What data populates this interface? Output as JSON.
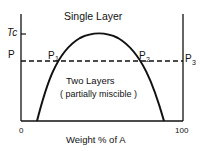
{
  "diagram": {
    "title_region_top": "Single Layer",
    "region_bottom_line1": "Two Layers",
    "region_bottom_line2": "( partially miscible )",
    "y_labels": {
      "tc": "Tc",
      "p": "P"
    },
    "points": {
      "p1": "P",
      "p1_sub": "1",
      "p2": "P",
      "p2_sub": "2",
      "p3": "P",
      "p3_sub": "3"
    },
    "x_axis": {
      "min_label": "0",
      "max_label": "100",
      "title": "Weight % of A"
    },
    "colors": {
      "line": "#111111",
      "background": "#ffffff"
    }
  }
}
